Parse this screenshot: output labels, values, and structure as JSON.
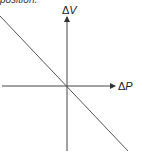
{
  "caption": "position.",
  "diagram": {
    "y_axis_label_delta": "Δ",
    "y_axis_label_var": "V",
    "x_axis_label_delta": "Δ",
    "x_axis_label_var": "P",
    "line_description": "straight line with negative slope through the origin",
    "colors": {
      "line": "#444444",
      "background": "#ffffff"
    }
  }
}
